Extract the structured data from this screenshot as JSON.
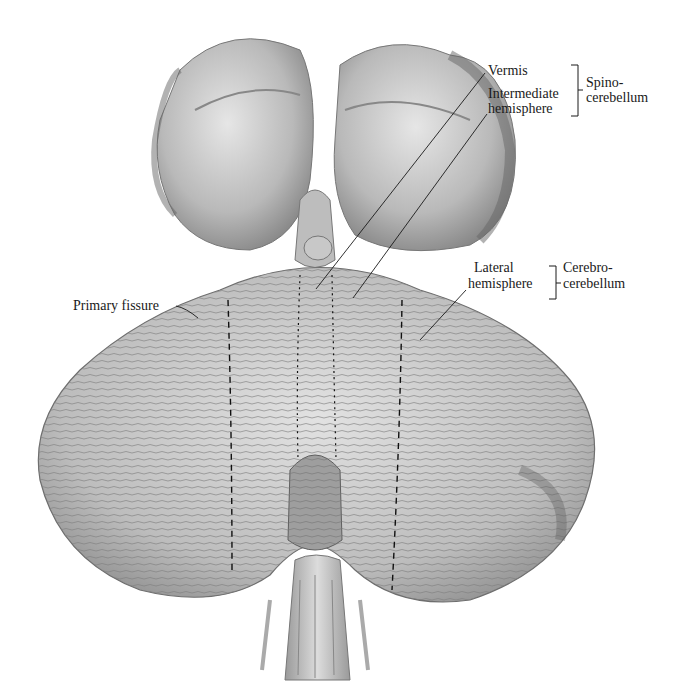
{
  "figure": {
    "colors": {
      "tissue_light": "#d9d9d9",
      "tissue_mid": "#a8a8a8",
      "tissue_dark": "#6e6e6e",
      "line": "#1a1a1a",
      "background": "#ffffff"
    }
  },
  "labels": {
    "vermis": "Vermis",
    "intermediate_line1": "Intermediate",
    "intermediate_line2": "hemisphere",
    "spino_line1": "Spino-",
    "spino_line2": "cerebellum",
    "lateral_line1": "Lateral",
    "lateral_line2": "hemisphere",
    "cerebro_line1": "Cerebro-",
    "cerebro_line2": "cerebellum",
    "primary_fissure": "Primary fissure"
  }
}
